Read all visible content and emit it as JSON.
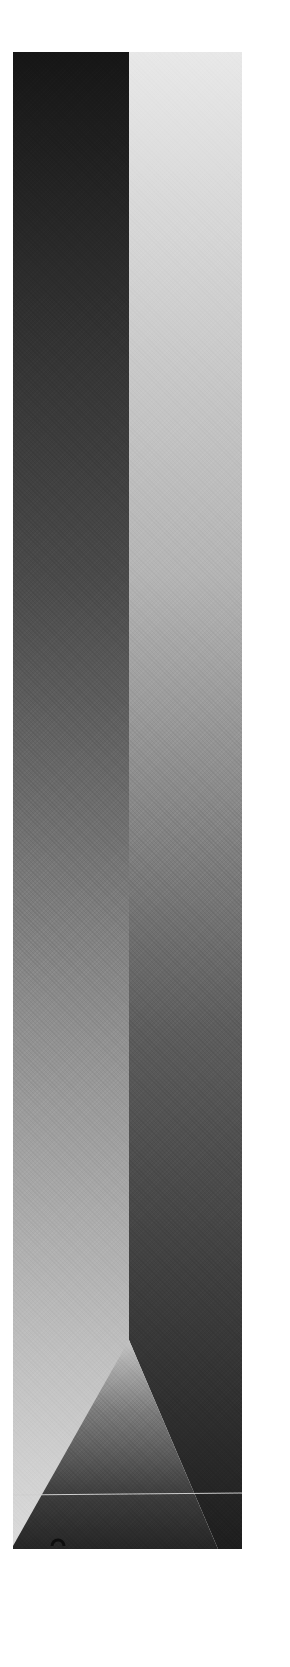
{
  "artwork": {
    "kind": "abstract grayscale print",
    "panels": {
      "left": {
        "gradient_top": "#161616",
        "gradient_bottom": "#d8d8d8"
      },
      "right": {
        "gradient_top": "#e6e6e6",
        "gradient_bottom": "#1e1e1e"
      }
    },
    "triangle": {
      "apex_color": "#bdbdbd",
      "base_color": "#2a2a2a"
    },
    "horizon_line_color": "#cfcfcf",
    "marker_color": "#111111",
    "page_background": "#ffffff"
  }
}
